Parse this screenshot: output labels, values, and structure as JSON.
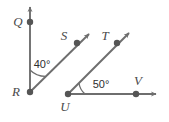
{
  "figure": {
    "type": "geometry-diagram",
    "background_color": "#ffffff",
    "line_color": "#6e6e6e",
    "point_color": "#555555",
    "label_color": "#4a4a4a",
    "angle_label_color": "#2e2e2e"
  },
  "points": [
    {
      "name": "Q",
      "label": "Q",
      "x": 30,
      "y": 22,
      "label_x": 18,
      "label_y": 26
    },
    {
      "name": "R",
      "label": "R",
      "x": 30,
      "y": 92,
      "label_x": 16,
      "label_y": 96
    },
    {
      "name": "S",
      "label": "S",
      "x": 77,
      "y": 43,
      "label_x": 62,
      "label_y": 40
    },
    {
      "name": "T",
      "label": "T",
      "x": 117,
      "y": 43,
      "label_x": 103,
      "label_y": 40
    },
    {
      "name": "U",
      "label": "U",
      "x": 68,
      "y": 94,
      "label_x": 61,
      "label_y": 112
    },
    {
      "name": "V",
      "label": "V",
      "x": 136,
      "y": 94,
      "label_x": 133,
      "label_y": 86
    }
  ],
  "rays": [
    {
      "name": "ray-RQ",
      "from": "R",
      "through": "Q",
      "tip_x": 30,
      "tip_y": 3
    },
    {
      "name": "ray-RS",
      "from": "R",
      "through": "S",
      "tip_x": 93,
      "tip_y": 30
    },
    {
      "name": "ray-UT",
      "from": "U",
      "through": "T",
      "tip_x": 133,
      "tip_y": 29
    },
    {
      "name": "ray-UV",
      "from": "U",
      "through": "V",
      "tip_x": 161,
      "tip_y": 94
    }
  ],
  "angles": [
    {
      "name": "angle-QRS",
      "vertex": "R",
      "label": "40°",
      "value": 40,
      "unit": "degrees",
      "label_x": 30,
      "label_y": 67,
      "arc_radius": 22
    },
    {
      "name": "angle-TUV",
      "vertex": "U",
      "label": "50°",
      "value": 50,
      "unit": "degrees",
      "label_x": 89,
      "label_y": 89,
      "arc_radius": 17
    }
  ]
}
